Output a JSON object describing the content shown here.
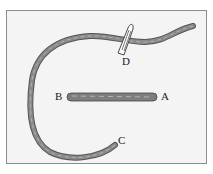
{
  "diagram": {
    "type": "embroidery stitch illustration",
    "labels": {
      "a": "A",
      "b": "B",
      "c": "C",
      "d": "D"
    },
    "colors": {
      "background": "#f4f4f4",
      "frame": "#8c8c8c",
      "thread": "#7a7a7a",
      "thread_dark": "#555555",
      "needle": "#ffffff"
    }
  }
}
